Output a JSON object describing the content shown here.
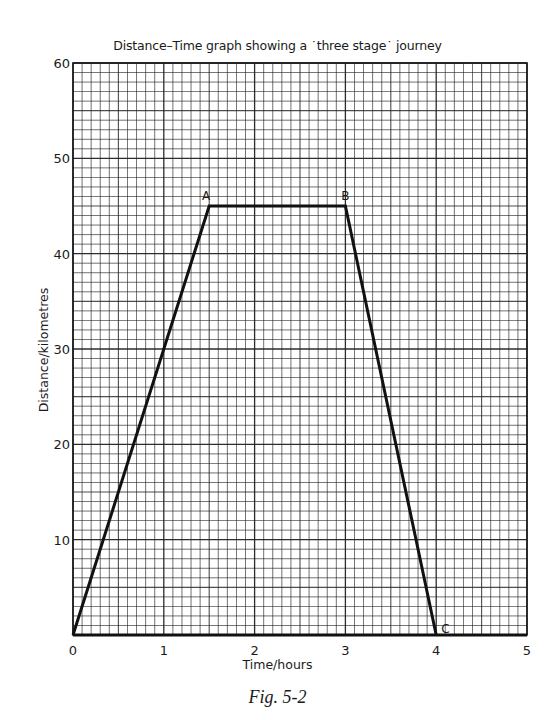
{
  "chart_data": {
    "type": "line",
    "xlabel": "Time/hours",
    "ylabel": "Distance/kilometres",
    "xlim": [
      0,
      5
    ],
    "ylim": [
      0,
      60
    ],
    "x_ticks": [
      0,
      1,
      2,
      3,
      4,
      5
    ],
    "y_ticks": [
      10,
      20,
      30,
      40,
      50,
      60
    ],
    "grid": true,
    "grid_minor_divisions": 10,
    "series": [
      {
        "name": "Journey",
        "points": [
          {
            "label": "",
            "x": 0,
            "y": 0
          },
          {
            "label": "A",
            "x": 1.5,
            "y": 45
          },
          {
            "label": "B",
            "x": 3.0,
            "y": 45
          },
          {
            "label": "C",
            "x": 4.0,
            "y": 0
          }
        ]
      }
    ],
    "caption": "Fig. 5-2"
  },
  "labels": {
    "title": "Distance–Time graph showing a ˙three stage˙ journey",
    "xlabel": "Time/hours",
    "ylabel": "Distance/kilometres",
    "caption": "Fig. 5-2"
  }
}
